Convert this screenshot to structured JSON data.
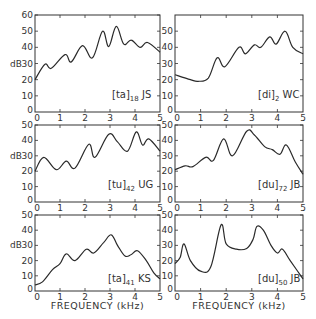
{
  "chart_data": [
    {
      "type": "line",
      "panel": "top-left",
      "label": {
        "phone": "[ta]",
        "index": "18",
        "speaker": "JS"
      },
      "xlabel": "",
      "ylabel": "dB",
      "xlim": [
        0,
        5
      ],
      "ylim": [
        0,
        60
      ],
      "xticks": [
        "0",
        "1",
        "2",
        "3",
        "4",
        "5"
      ],
      "yticks": [
        "0",
        "10",
        "20",
        "30",
        "40",
        "50",
        "60"
      ],
      "x": [
        0,
        0.4,
        0.65,
        1.2,
        1.45,
        1.9,
        2.3,
        2.7,
        2.95,
        3.25,
        3.55,
        3.85,
        4.2,
        4.5,
        5
      ],
      "y": [
        20,
        29.5,
        27,
        35.5,
        31,
        41,
        33.5,
        50,
        40.5,
        53,
        42,
        44.5,
        40,
        43,
        37
      ]
    },
    {
      "type": "line",
      "panel": "top-right",
      "label": {
        "phone": "[di]",
        "index": "2",
        "speaker": "WC"
      },
      "xlabel": "",
      "ylabel": "",
      "xlim": [
        0,
        5
      ],
      "ylim": [
        0,
        60
      ],
      "xticks": [
        "0",
        "1",
        "2",
        "3",
        "4",
        "5"
      ],
      "yticks": [
        "0",
        "10",
        "20",
        "30",
        "40",
        "50"
      ],
      "x": [
        0,
        0.6,
        0.9,
        1.3,
        1.65,
        1.95,
        2.5,
        2.75,
        3.1,
        3.35,
        3.7,
        3.95,
        4.3,
        4.6,
        5
      ],
      "y": [
        23,
        20,
        19,
        21,
        33.5,
        28,
        40,
        36,
        41.5,
        40,
        46.5,
        42,
        50,
        40,
        36
      ]
    },
    {
      "type": "line",
      "panel": "middle-left",
      "label": {
        "phone": "[tu]",
        "index": "42",
        "speaker": "UG"
      },
      "xlabel": "",
      "ylabel": "dB",
      "xlim": [
        0,
        5
      ],
      "ylim": [
        0,
        50
      ],
      "xticks": [
        "0",
        "1",
        "2",
        "3",
        "4",
        "5"
      ],
      "yticks": [
        "0",
        "10",
        "20",
        "30",
        "40",
        "50"
      ],
      "x": [
        0,
        0.35,
        0.85,
        1.25,
        1.6,
        2.15,
        2.4,
        2.95,
        3.3,
        3.7,
        4.05,
        4.3,
        4.55,
        5
      ],
      "y": [
        20,
        29,
        21,
        26.5,
        22,
        37.5,
        29,
        44,
        39,
        33,
        45.5,
        37,
        41,
        33
      ]
    },
    {
      "type": "line",
      "panel": "middle-right",
      "label": {
        "phone": "[du]",
        "index": "72",
        "speaker": "JB"
      },
      "xlabel": "",
      "ylabel": "",
      "xlim": [
        0,
        5
      ],
      "ylim": [
        0,
        50
      ],
      "xticks": [
        "0",
        "1",
        "2",
        "3",
        "4",
        "5"
      ],
      "yticks": [
        "0",
        "10",
        "20",
        "30",
        "40",
        "50"
      ],
      "x": [
        0,
        0.4,
        0.7,
        1.2,
        1.5,
        1.9,
        2.25,
        2.8,
        3.1,
        3.5,
        3.8,
        4.1,
        4.35,
        4.7,
        5
      ],
      "y": [
        21,
        23.5,
        23,
        29,
        27,
        41,
        30,
        46,
        43.5,
        36,
        34,
        31,
        37,
        26,
        18
      ]
    },
    {
      "type": "line",
      "panel": "bottom-left",
      "label": {
        "phone": "[ta]",
        "index": "41",
        "speaker": "KS"
      },
      "xlabel": "FREQUENCY (kHz)",
      "ylabel": "dB",
      "xlim": [
        0,
        5
      ],
      "ylim": [
        0,
        50
      ],
      "xticks": [
        "0",
        "1",
        "2",
        "3",
        "4",
        "5"
      ],
      "yticks": [
        "0",
        "10",
        "20",
        "30",
        "40",
        "50"
      ],
      "x": [
        0,
        0.3,
        0.7,
        1.0,
        1.25,
        1.6,
        2.05,
        2.35,
        2.75,
        3.05,
        3.3,
        3.6,
        3.85,
        4.1,
        4.45,
        4.75,
        5
      ],
      "y": [
        4,
        6,
        14,
        18,
        24.5,
        20,
        27.5,
        25,
        32,
        37,
        30,
        23,
        24,
        26.5,
        20,
        12,
        8
      ]
    },
    {
      "type": "line",
      "panel": "bottom-right",
      "label": {
        "phone": "[du]",
        "index": "50",
        "speaker": "JB"
      },
      "xlabel": "FREQUENCY (kHz)",
      "ylabel": "",
      "xlim": [
        0,
        5
      ],
      "ylim": [
        0,
        50
      ],
      "xticks": [
        "0",
        "1",
        "2",
        "3",
        "4",
        "5"
      ],
      "yticks": [
        "0",
        "10",
        "20",
        "30",
        "40",
        "50"
      ],
      "x": [
        0,
        0.2,
        0.35,
        0.6,
        1.0,
        1.4,
        1.8,
        2.0,
        2.4,
        2.8,
        3.05,
        3.2,
        3.45,
        3.75,
        4.0,
        4.2,
        4.5,
        5
      ],
      "y": [
        18,
        22,
        31,
        20,
        13,
        16,
        43.5,
        31,
        27.5,
        28,
        34,
        42.5,
        40,
        30,
        25,
        27.5,
        20,
        8
      ]
    }
  ],
  "layout": {
    "panels": [
      {
        "x0": 35,
        "x1": 160,
        "ytop": 15,
        "ybot": 112
      },
      {
        "x0": 175,
        "x1": 303,
        "ytop": 15,
        "ybot": 112
      },
      {
        "x0": 35,
        "x1": 160,
        "ytop": 125,
        "ybot": 202
      },
      {
        "x0": 175,
        "x1": 303,
        "ytop": 125,
        "ybot": 202
      },
      {
        "x0": 35,
        "x1": 160,
        "ytop": 215,
        "ybot": 291
      },
      {
        "x0": 175,
        "x1": 303,
        "ytop": 215,
        "ybot": 291
      }
    ],
    "label_pos": [
      {
        "x": 112,
        "y": 98
      },
      {
        "x": 258,
        "y": 98
      },
      {
        "x": 108,
        "y": 188
      },
      {
        "x": 258,
        "y": 188
      },
      {
        "x": 108,
        "y": 282
      },
      {
        "x": 258,
        "y": 282
      }
    ]
  }
}
